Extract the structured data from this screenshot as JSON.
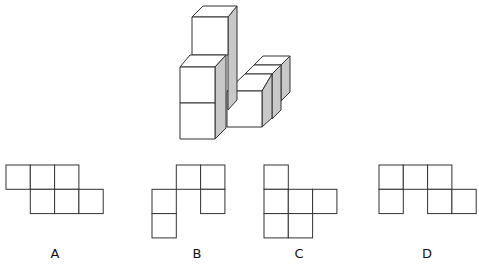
{
  "puzzle": {
    "type": "cube-net-matching",
    "figure": {
      "description": "isometric stack of unit cubes: a 3-high column at left-back, a 2-high column in front, and a row of 3 cubes extending back to the right",
      "face_fill": "#ffffff",
      "shade_fill": "#c8c8c8",
      "stroke": "#333333"
    },
    "options": [
      {
        "label": "A",
        "cells": [
          [
            0,
            0
          ],
          [
            1,
            0
          ],
          [
            2,
            0
          ],
          [
            1,
            1
          ],
          [
            2,
            1
          ],
          [
            3,
            1
          ]
        ]
      },
      {
        "label": "B",
        "cells": [
          [
            1,
            0
          ],
          [
            2,
            0
          ],
          [
            0,
            1
          ],
          [
            2,
            1
          ],
          [
            0,
            2
          ]
        ]
      },
      {
        "label": "C",
        "cells": [
          [
            0,
            0
          ],
          [
            0,
            1
          ],
          [
            1,
            1
          ],
          [
            2,
            1
          ],
          [
            0,
            2
          ],
          [
            1,
            2
          ]
        ]
      },
      {
        "label": "D",
        "cells": [
          [
            0,
            0
          ],
          [
            1,
            0
          ],
          [
            2,
            0
          ],
          [
            0,
            1
          ],
          [
            2,
            1
          ],
          [
            3,
            1
          ]
        ]
      }
    ],
    "labels": [
      "A",
      "B",
      "C",
      "D"
    ]
  }
}
